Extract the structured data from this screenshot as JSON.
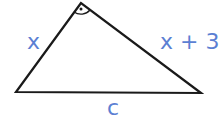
{
  "diagram": {
    "type": "right-triangle",
    "labels": {
      "leg_left": "x",
      "leg_right": "x + 3",
      "hypotenuse": "c"
    },
    "right_angle_marker": "arc-with-dot",
    "colors": {
      "label": "#5b7fd3",
      "stroke": "#1a1a1a"
    }
  }
}
